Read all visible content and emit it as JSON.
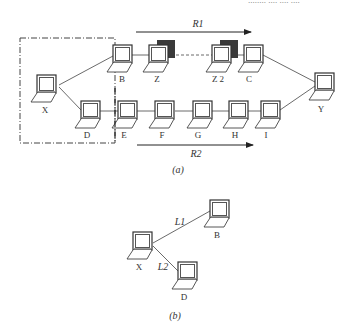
{
  "header_fragment": "........ .... .... ....",
  "figure_a": {
    "caption": "(a)",
    "route_labels": {
      "r1": "R1",
      "r2": "R2"
    },
    "nodes": [
      {
        "id": "X",
        "label": "X",
        "x": 37,
        "y": 75,
        "shadow": false
      },
      {
        "id": "B",
        "label": "B",
        "x": 113,
        "y": 45,
        "shadow": false
      },
      {
        "id": "Z",
        "label": "Z",
        "x": 149,
        "y": 45,
        "shadow": true
      },
      {
        "id": "Z2",
        "label": "Z 2",
        "x": 212,
        "y": 45,
        "shadow": true
      },
      {
        "id": "C",
        "label": "C",
        "x": 244,
        "y": 45,
        "shadow": false
      },
      {
        "id": "Y",
        "label": "Y",
        "x": 315,
        "y": 73,
        "shadow": false
      },
      {
        "id": "D",
        "label": "D",
        "x": 81,
        "y": 101,
        "shadow": false
      },
      {
        "id": "E",
        "label": "E",
        "x": 118,
        "y": 101,
        "shadow": false
      },
      {
        "id": "F",
        "label": "F",
        "x": 155,
        "y": 101,
        "shadow": false
      },
      {
        "id": "G",
        "label": "G",
        "x": 193,
        "y": 101,
        "shadow": false
      },
      {
        "id": "H",
        "label": "H",
        "x": 229,
        "y": 101,
        "shadow": false
      },
      {
        "id": "I",
        "label": "I",
        "x": 261,
        "y": 101,
        "shadow": false
      }
    ]
  },
  "figure_b": {
    "caption": "(b)",
    "link_labels": {
      "l1": "L1",
      "l2": "L2"
    },
    "nodes": [
      {
        "id": "X",
        "label": "X",
        "x": 133,
        "y": 232
      },
      {
        "id": "B",
        "label": "B",
        "x": 210,
        "y": 200
      },
      {
        "id": "D",
        "label": "D",
        "x": 178,
        "y": 262
      }
    ]
  },
  "colors": {
    "line": "#444444",
    "shadow": "#3a3a3a",
    "screen_bezel": "#555555"
  }
}
